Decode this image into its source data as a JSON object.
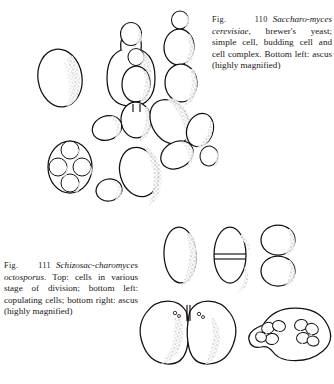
{
  "page": {
    "kind": "scanned-textbook-plate",
    "background_color": "#ffffff",
    "ink_color": "#14100d",
    "width": 334,
    "height": 384
  },
  "figures": [
    {
      "id": "fig-110",
      "number": "110",
      "number_prefix": "Fig.",
      "caption_parts": {
        "label": "Fig.",
        "number": "110",
        "species_italic": "Saccharo-myces cerevisiae",
        "rest": ", brewer's yeast; simple cell, budding cell and cell complex. Bottom left: ascus (highly magnified)"
      },
      "caption_text": "Fig. 110 Saccharomyces cerevisiae, brewer's yeast; simple cell, budding cell and cell complex. Bottom left: ascus (highly magnified)",
      "caption_lines": [
        "Fig. 110  Saccharo-",
        "myces cerevisiae, brew-",
        "er's yeast; simple cell,",
        "budding cell and cell",
        "complex. Bottom",
        "left: ascus (highly",
        "magnified)"
      ],
      "subjects": [
        "simple cell",
        "budding cell",
        "cell complex",
        "ascus with four spores"
      ]
    },
    {
      "id": "fig-111",
      "number": "111",
      "number_prefix": "Fig.",
      "caption_parts": {
        "label": "Fig.",
        "number": "111",
        "species_italic": "Schizosac-charomyces octosporus",
        "rest": ". Top: cells in various stage of division; bottom left: copulating cells; bottom right: ascus (highly magnified)"
      },
      "caption_text": "Fig. 111 Schizosaccharomyces octosporus. Top: cells in various stage of division; bottom left: copulating cells; bottom right: ascus (highly magnified)",
      "caption_lines": [
        "Fig. 111    Schizosac-",
        "charomyces  octosporus.",
        "Top: cells in various",
        "stage of division; bot-",
        "tom left: copulating",
        "cells; bottom right:",
        "ascus (highly mag-",
        "nified)"
      ],
      "subjects": [
        "cells in various stage of division",
        "copulating cells",
        "ascus with eight spores"
      ]
    }
  ]
}
